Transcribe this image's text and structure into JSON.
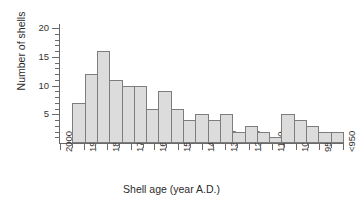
{
  "chart_data": {
    "type": "bar",
    "title": "",
    "xlabel": "Shell age (year A.D.)",
    "ylabel": "Number of shells",
    "ylim": [
      0,
      20
    ],
    "ytick_labels": [
      "5",
      "10",
      "15",
      "20"
    ],
    "ytick_values": [
      5,
      10,
      15,
      20
    ],
    "y_minor_step": 1,
    "grid": false,
    "legend": null,
    "xtick_labels": [
      "2000",
      "1900",
      "1800",
      "1700",
      "1600",
      "1500",
      "1400",
      "1300",
      "1200",
      "1100",
      "1000",
      "950",
      "<950"
    ],
    "bin_edges_index": [
      0,
      1,
      2,
      3,
      4,
      5,
      6,
      7,
      8,
      9,
      10,
      11,
      12,
      13,
      14,
      15,
      16,
      17,
      18,
      19,
      20,
      21,
      22,
      23,
      24
    ],
    "categories": [
      "2000-1950",
      "1950-1900",
      "1900-1850",
      "1850-1800",
      "1800-1750",
      "1750-1700",
      "1700-1650",
      "1650-1600",
      "1600-1550",
      "1550-1500",
      "1500-1450",
      "1450-1400",
      "1400-1350",
      "1350-1300",
      "1300-1250",
      "1250-1200",
      "1200-1150",
      "1150-1100",
      "1100-1050",
      "1050-1000",
      "1000-975",
      "975-950",
      "<950"
    ],
    "values": [
      0,
      7,
      12,
      16,
      11,
      10,
      10,
      6,
      9,
      6,
      4,
      5,
      4,
      5,
      2,
      3,
      2,
      1,
      5,
      4,
      3,
      2,
      2
    ],
    "bar_fill_color": "#dcdcdc",
    "bar_edge_color": "#7d7d7d",
    "axis_color": "#6a6a6a"
  }
}
